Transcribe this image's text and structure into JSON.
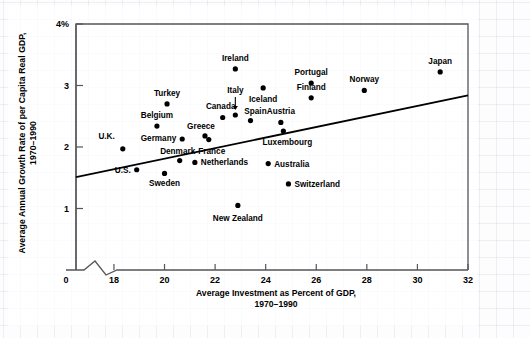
{
  "figure": {
    "y_axis_title": "Average Annual Growth Rate of per Capita Real GDP,\n1970–1990",
    "y_axis_title_line1": "Average Annual Growth Rate of per Capita Real GDP,",
    "y_axis_title_line2": "1970–1990",
    "x_axis_title_line1": "Average Investment as Percent of GDP,",
    "x_axis_title_line2": "1970–1990",
    "source_note": "SOURCE: Economic Report of the President (Washington, D.C.: U.S. Government Printing Office, 1995), p. 28."
  },
  "chart_data": {
    "type": "scatter",
    "title": "",
    "xlabel": "Average Investment as Percent of GDP, 1970–1990",
    "ylabel": "Average Annual Growth Rate of per Capita Real GDP, 1970–1990",
    "xlim": [
      16.5,
      32
    ],
    "ylim": [
      0,
      4
    ],
    "x_ticks": [
      0,
      18,
      20,
      22,
      24,
      26,
      28,
      30,
      32
    ],
    "x_tick_labels": [
      "0",
      "18",
      "20",
      "22",
      "24",
      "26",
      "28",
      "30",
      "32"
    ],
    "y_ticks": [
      1,
      2,
      3,
      4
    ],
    "y_tick_labels": [
      "1",
      "2",
      "3",
      "4%"
    ],
    "axis_break": true,
    "grid": false,
    "legend": "none",
    "trendline": {
      "label": "regression line",
      "x_start": 16.5,
      "y_start": 1.51,
      "x_end": 32.0,
      "y_end": 2.84
    },
    "points": [
      {
        "name": "U.K.",
        "x": 18.35,
        "y": 1.97,
        "label_pos": "left"
      },
      {
        "name": "U.S.",
        "x": 18.9,
        "y": 1.63,
        "label_pos": "left"
      },
      {
        "name": "Belgium",
        "x": 19.7,
        "y": 2.34,
        "label_pos": "above"
      },
      {
        "name": "Turkey",
        "x": 20.1,
        "y": 2.7,
        "label_pos": "above"
      },
      {
        "name": "Sweden",
        "x": 20.0,
        "y": 1.57,
        "label_pos": "below"
      },
      {
        "name": "Germany",
        "x": 20.7,
        "y": 2.13,
        "label_pos": "left"
      },
      {
        "name": "Denmark",
        "x": 20.6,
        "y": 1.78,
        "label_pos": "above"
      },
      {
        "name": "Greece",
        "x": 21.6,
        "y": 2.18,
        "label_pos": "above"
      },
      {
        "name": "Netherlands",
        "x": 21.2,
        "y": 1.75,
        "label_pos": "right"
      },
      {
        "name": "France",
        "x": 21.75,
        "y": 2.12,
        "label_pos": "below"
      },
      {
        "name": "Canada",
        "x": 22.3,
        "y": 2.48,
        "label_pos": "above"
      },
      {
        "name": "Italy",
        "x": 22.8,
        "y": 2.52,
        "label_pos": "above-arrow"
      },
      {
        "name": "Ireland",
        "x": 22.8,
        "y": 3.27,
        "label_pos": "above"
      },
      {
        "name": "New Zealand",
        "x": 22.9,
        "y": 1.05,
        "label_pos": "below"
      },
      {
        "name": "Spain",
        "x": 23.4,
        "y": 2.43,
        "label_pos": "above"
      },
      {
        "name": "Iceland",
        "x": 23.9,
        "y": 2.96,
        "label_pos": "below"
      },
      {
        "name": "Australia",
        "x": 24.1,
        "y": 1.73,
        "label_pos": "right"
      },
      {
        "name": "Austria",
        "x": 24.6,
        "y": 2.4,
        "label_pos": "above"
      },
      {
        "name": "Switzerland",
        "x": 24.9,
        "y": 1.4,
        "label_pos": "right"
      },
      {
        "name": "Luxembourg",
        "x": 24.7,
        "y": 2.26,
        "label_pos": "below"
      },
      {
        "name": "Finland",
        "x": 25.8,
        "y": 2.8,
        "label_pos": "above"
      },
      {
        "name": "Portugal",
        "x": 25.8,
        "y": 3.04,
        "label_pos": "above"
      },
      {
        "name": "Norway",
        "x": 27.9,
        "y": 2.92,
        "label_pos": "above"
      },
      {
        "name": "Japan",
        "x": 30.9,
        "y": 3.22,
        "label_pos": "above"
      }
    ]
  }
}
